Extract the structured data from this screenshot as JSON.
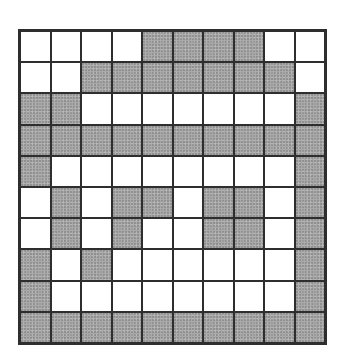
{
  "grid": {
    "rows": 10,
    "cols": 10,
    "fill_color": "#a9a9a9",
    "empty_color": "#ffffff",
    "line_color": "#2e2e2e",
    "cells": [
      [
        0,
        0,
        0,
        0,
        1,
        1,
        1,
        1,
        0,
        0
      ],
      [
        0,
        0,
        1,
        1,
        1,
        1,
        1,
        1,
        1,
        0
      ],
      [
        1,
        1,
        0,
        0,
        0,
        0,
        0,
        0,
        0,
        1
      ],
      [
        1,
        1,
        1,
        1,
        1,
        1,
        1,
        1,
        1,
        1
      ],
      [
        1,
        0,
        0,
        0,
        0,
        0,
        0,
        0,
        0,
        1
      ],
      [
        0,
        1,
        0,
        1,
        1,
        0,
        1,
        1,
        0,
        1
      ],
      [
        0,
        1,
        0,
        1,
        0,
        0,
        1,
        1,
        0,
        1
      ],
      [
        1,
        0,
        1,
        0,
        0,
        0,
        0,
        0,
        0,
        1
      ],
      [
        1,
        0,
        0,
        0,
        0,
        0,
        0,
        0,
        0,
        1
      ],
      [
        1,
        1,
        1,
        1,
        1,
        1,
        1,
        1,
        1,
        1
      ]
    ]
  }
}
